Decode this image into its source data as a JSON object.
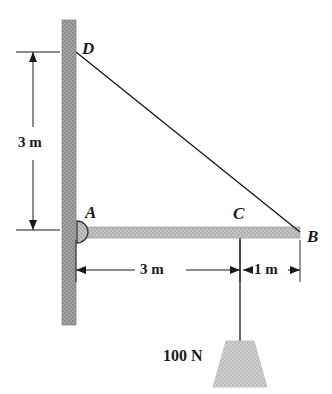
{
  "figure": {
    "colors": {
      "wall_fill": "#9a9a9a",
      "beam_fill": "#b9b9b9",
      "weight_fill": "#c8c8c8",
      "line": "#1a1a1a",
      "background": "#ffffff"
    }
  },
  "points": [
    {
      "id": "D",
      "label": "D",
      "x": 76,
      "y": 52,
      "description": "cable anchor on wall"
    },
    {
      "id": "A",
      "label": "A",
      "x": 76,
      "y": 232,
      "description": "pin support at wall"
    },
    {
      "id": "C",
      "label": "C",
      "x": 240,
      "y": 232,
      "description": "load attachment point on beam"
    },
    {
      "id": "B",
      "label": "B",
      "x": 300,
      "y": 232,
      "description": "free end of beam"
    }
  ],
  "dimensions": [
    {
      "id": "vertical-3m",
      "label": "3 m",
      "orientation": "vertical",
      "from": "A",
      "to": "D",
      "value": 3,
      "unit": "m"
    },
    {
      "id": "horizontal-3m",
      "label": "3 m",
      "orientation": "horizontal",
      "from": "A",
      "to": "C",
      "value": 3,
      "unit": "m"
    },
    {
      "id": "horizontal-1m",
      "label": "1 m",
      "orientation": "horizontal",
      "from": "C",
      "to": "B",
      "value": 1,
      "unit": "m"
    }
  ],
  "load": {
    "label": "100 N",
    "magnitude": 100,
    "unit": "N",
    "applied_at": "C",
    "direction": "down"
  },
  "members": [
    {
      "id": "beam-AB",
      "from": "A",
      "to": "B",
      "type": "beam"
    },
    {
      "id": "cable-DB",
      "from": "D",
      "to": "B",
      "type": "cable"
    },
    {
      "id": "cord-C",
      "from": "C",
      "to": "weight",
      "type": "cord"
    }
  ]
}
